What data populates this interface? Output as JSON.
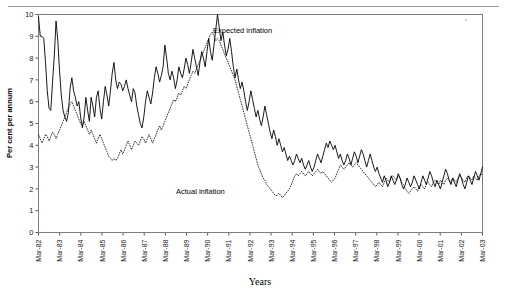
{
  "chart_data": {
    "type": "line",
    "title": "",
    "xlabel": "Years",
    "ylabel": "Per cent per annum",
    "ylim": [
      0,
      10
    ],
    "y_ticks": [
      0,
      1,
      2,
      3,
      4,
      5,
      6,
      7,
      8,
      9,
      10
    ],
    "grid": false,
    "legend_position": "inline-annotation",
    "x_tick_labels": [
      "Mar-82",
      "Mar-83",
      "Mar-84",
      "Mar-85",
      "Mar-86",
      "Mar-87",
      "Mar-88",
      "Mar-89",
      "Mar-90",
      "Mar-91",
      "Mar-92",
      "Mar-93",
      "Mar-94",
      "Mar-95",
      "Mar-96",
      "Mar-97",
      "Mar-98",
      "Mar-99",
      "Mar-00",
      "Mar-01",
      "Mar-02",
      "Mar-03"
    ],
    "annotations": [
      {
        "text": "Expected inflation",
        "series": "expected"
      },
      {
        "text": "Actual inflation",
        "series": "actual"
      }
    ],
    "series": [
      {
        "name": "Expected inflation",
        "style": "solid",
        "color": "#000000",
        "values": [
          9.9,
          9.0,
          9.0,
          8.9,
          7.8,
          6.5,
          5.7,
          5.6,
          6.9,
          8.1,
          9.7,
          8.8,
          7.4,
          6.3,
          5.6,
          5.3,
          5.1,
          5.5,
          6.6,
          7.1,
          6.5,
          6.2,
          5.8,
          6.0,
          5.3,
          4.8,
          5.3,
          6.2,
          5.6,
          5.1,
          6.2,
          5.8,
          5.3,
          6.2,
          6.5,
          5.7,
          5.2,
          6.0,
          6.7,
          6.3,
          5.8,
          6.5,
          7.3,
          7.8,
          7.0,
          6.6,
          6.9,
          6.8,
          6.5,
          6.7,
          7.0,
          6.6,
          6.3,
          6.0,
          6.6,
          6.4,
          5.8,
          5.4,
          5.0,
          4.8,
          5.3,
          6.0,
          6.5,
          6.2,
          5.9,
          6.4,
          7.1,
          7.6,
          7.3,
          6.9,
          7.2,
          7.6,
          8.6,
          8.0,
          7.3,
          7.0,
          7.4,
          7.1,
          6.6,
          7.0,
          7.6,
          7.3,
          7.1,
          7.5,
          8.0,
          7.7,
          7.3,
          7.8,
          8.4,
          8.0,
          7.6,
          7.2,
          7.8,
          8.3,
          8.0,
          7.6,
          8.3,
          8.9,
          8.3,
          7.9,
          8.6,
          9.3,
          10.0,
          9.4,
          8.8,
          9.2,
          8.6,
          8.1,
          8.4,
          8.9,
          8.3,
          7.6,
          7.1,
          7.5,
          7.0,
          6.6,
          6.9,
          6.5,
          6.0,
          5.6,
          6.0,
          6.5,
          6.1,
          5.7,
          5.3,
          5.6,
          5.2,
          4.9,
          5.3,
          5.8,
          5.4,
          5.0,
          4.6,
          4.3,
          4.7,
          4.4,
          4.0,
          4.3,
          4.0,
          3.7,
          3.9,
          3.6,
          3.3,
          3.5,
          3.3,
          3.1,
          3.3,
          3.6,
          3.4,
          3.2,
          3.4,
          3.1,
          2.9,
          3.1,
          3.3,
          3.0,
          2.8,
          3.0,
          3.3,
          3.6,
          3.4,
          3.2,
          3.5,
          3.8,
          4.1,
          3.9,
          4.2,
          4.0,
          3.8,
          4.0,
          3.7,
          3.4,
          3.6,
          3.3,
          3.1,
          3.3,
          3.6,
          3.4,
          3.1,
          3.4,
          3.7,
          3.5,
          3.2,
          3.5,
          3.8,
          3.6,
          3.3,
          3.0,
          3.3,
          3.6,
          3.3,
          3.0,
          2.8,
          3.0,
          2.7,
          2.5,
          2.3,
          2.6,
          2.4,
          2.1,
          2.3,
          2.6,
          2.4,
          2.2,
          2.4,
          2.7,
          2.5,
          2.2,
          2.0,
          2.2,
          2.5,
          2.3,
          2.1,
          2.3,
          2.6,
          2.4,
          2.2,
          2.0,
          2.3,
          2.6,
          2.4,
          2.2,
          2.5,
          2.8,
          2.6,
          2.3,
          2.1,
          2.4,
          2.2,
          2.0,
          2.3,
          2.6,
          2.9,
          2.7,
          2.4,
          2.2,
          2.5,
          2.3,
          2.1,
          2.4,
          2.7,
          2.5,
          2.2,
          2.0,
          2.3,
          2.6,
          2.4,
          2.2,
          2.5,
          2.8,
          2.6,
          2.4,
          2.7,
          3.0
        ]
      },
      {
        "name": "Actual inflation",
        "style": "dotted",
        "color": "#1b1b1b",
        "values": [
          4.5,
          4.3,
          4.1,
          4.3,
          4.5,
          4.4,
          4.2,
          4.4,
          4.6,
          4.5,
          4.3,
          4.5,
          4.7,
          4.9,
          5.1,
          5.3,
          5.5,
          5.7,
          5.9,
          6.0,
          5.8,
          5.6,
          5.4,
          5.2,
          5.0,
          4.9,
          5.1,
          4.9,
          4.7,
          4.5,
          4.7,
          4.5,
          4.3,
          4.1,
          4.3,
          4.5,
          4.3,
          4.1,
          3.9,
          3.7,
          3.5,
          3.4,
          3.3,
          3.4,
          3.3,
          3.4,
          3.6,
          3.8,
          3.6,
          3.8,
          4.0,
          4.2,
          4.0,
          3.8,
          4.0,
          4.2,
          4.1,
          4.0,
          4.2,
          4.4,
          4.3,
          4.1,
          4.3,
          4.5,
          4.3,
          4.1,
          4.3,
          4.5,
          4.7,
          4.9,
          4.7,
          4.9,
          5.1,
          5.3,
          5.5,
          5.7,
          5.9,
          6.1,
          6.0,
          6.2,
          6.4,
          6.3,
          6.5,
          6.7,
          6.6,
          6.8,
          7.0,
          7.2,
          7.4,
          7.3,
          7.5,
          7.7,
          7.9,
          8.1,
          8.3,
          8.5,
          8.7,
          8.9,
          9.1,
          9.2,
          9.0,
          8.8,
          8.9,
          8.8,
          8.6,
          8.4,
          8.2,
          8.0,
          7.8,
          7.6,
          7.4,
          7.2,
          7.0,
          6.7,
          6.4,
          6.1,
          5.8,
          5.5,
          5.2,
          4.9,
          4.6,
          4.3,
          4.0,
          3.7,
          3.4,
          3.1,
          2.9,
          2.7,
          2.5,
          2.4,
          2.2,
          2.1,
          2.0,
          1.9,
          1.8,
          1.7,
          1.7,
          1.8,
          1.7,
          1.6,
          1.7,
          1.8,
          1.9,
          2.0,
          2.2,
          2.4,
          2.6,
          2.7,
          2.6,
          2.7,
          2.8,
          2.7,
          2.6,
          2.7,
          2.8,
          2.7,
          2.6,
          2.7,
          2.8,
          2.9,
          2.8,
          2.7,
          2.8,
          2.7,
          2.6,
          2.5,
          2.4,
          2.3,
          2.4,
          2.5,
          2.7,
          2.9,
          3.1,
          3.0,
          2.9,
          3.0,
          3.1,
          3.2,
          3.1,
          3.0,
          3.1,
          3.2,
          3.1,
          3.0,
          2.9,
          2.8,
          2.7,
          2.6,
          2.5,
          2.4,
          2.3,
          2.2,
          2.1,
          2.2,
          2.3,
          2.2,
          2.1,
          2.3,
          2.5,
          2.4,
          2.3,
          2.5,
          2.6,
          2.5,
          2.4,
          2.6,
          2.5,
          2.3,
          2.2,
          2.0,
          1.9,
          1.8,
          1.9,
          2.0,
          2.1,
          2.0,
          1.9,
          2.1,
          2.2,
          2.1,
          2.0,
          2.2,
          2.3,
          2.2,
          2.1,
          2.3,
          2.4,
          2.3,
          2.2,
          2.4,
          2.3,
          2.2,
          2.4,
          2.5,
          2.4,
          2.3,
          2.5,
          2.4,
          2.3,
          2.5,
          2.6,
          2.5,
          2.4,
          2.3,
          2.5,
          2.6,
          2.5,
          2.4,
          2.6,
          2.5,
          2.4,
          2.6,
          2.7,
          2.6
        ]
      }
    ]
  }
}
